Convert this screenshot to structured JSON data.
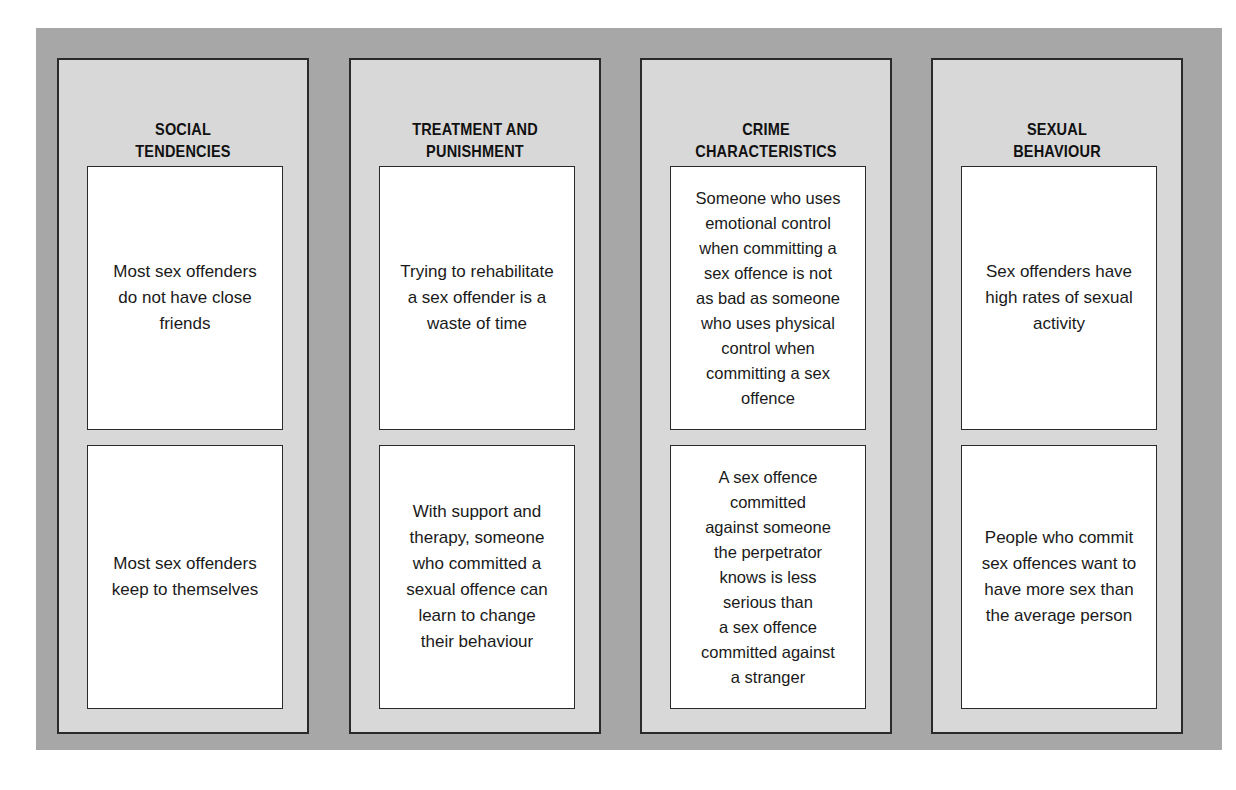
{
  "figure": {
    "columns": [
      {
        "title": "SOCIAL\nTENDENCIES",
        "cards": [
          "Most sex offenders\ndo not have close\nfriends",
          "Most sex offenders\nkeep to themselves"
        ]
      },
      {
        "title": "TREATMENT AND\nPUNISHMENT",
        "cards": [
          "Trying to rehabilitate\na sex offender is a\nwaste of time",
          "With support and\ntherapy, someone\nwho committed a\nsexual offence can\nlearn to change\ntheir behaviour"
        ]
      },
      {
        "title": "CRIME\nCHARACTERISTICS",
        "cards": [
          "Someone who uses\nemotional control\nwhen committing a\nsex offence is not\nas bad as someone\nwho uses physical\ncontrol when\ncommitting a sex\noffence",
          "A sex offence\ncommitted\nagainst someone\nthe perpetrator\nknows is less\nserious than\na sex offence\ncommitted against\na stranger"
        ]
      },
      {
        "title": "SEXUAL\nBEHAVIOUR",
        "cards": [
          "Sex offenders have\nhigh rates of sexual\nactivity",
          "People who commit\nsex offences want to\nhave more sex than\nthe average person"
        ]
      }
    ]
  },
  "colors": {
    "outer_panel": "#a7a7a7",
    "column_bg": "#d8d8d8",
    "card_bg": "#ffffff",
    "border": "#2a2a2a",
    "text": "#1a1a1a"
  }
}
